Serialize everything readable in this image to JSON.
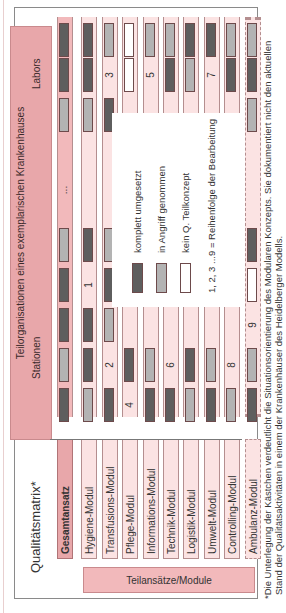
{
  "figure": {
    "title": "Qualitätsmatrix*",
    "header": {
      "title": "Teilorganisationen eines exemplarischen Krankenhauses",
      "group_left": "Stationen",
      "group_right": "Labors",
      "ellipsis": "..."
    },
    "side_label": "Teilansätze/Module",
    "columns": [
      "S1",
      "S2",
      "S3",
      "S4",
      "S5",
      "...",
      "L1",
      "L2",
      "L3"
    ],
    "rows": [
      {
        "label": "Gesamtansatz",
        "cells": [
          "dark",
          "light",
          "dark",
          "dark",
          "light",
          "...",
          "light",
          "dark",
          "dark"
        ]
      },
      {
        "label": "Hygiene-Modul",
        "cells": [
          "light",
          "dark",
          "dark",
          "1",
          "dark",
          "",
          "light",
          "dark",
          "dark"
        ]
      },
      {
        "label": "Transfusions-Modul",
        "cells": [
          "dark",
          "2",
          "light",
          "dark",
          "light",
          "",
          "dark",
          "3",
          "light"
        ]
      },
      {
        "label": "Pflege-Modul",
        "cells": [
          "4",
          "dark",
          "",
          "",
          "",
          "",
          "",
          "white",
          "white"
        ]
      },
      {
        "label": "Informations-Modul",
        "cells": [
          "dark",
          "light",
          "",
          "",
          "",
          "",
          "",
          "5",
          "light"
        ]
      },
      {
        "label": "Technik-Modul",
        "cells": [
          "dark",
          "6",
          "",
          "",
          "",
          "",
          "",
          "dark",
          "light"
        ]
      },
      {
        "label": "Logistik-Modul",
        "cells": [
          "light",
          "dark",
          "",
          "",
          "",
          "",
          "",
          "light",
          "dark"
        ]
      },
      {
        "label": "Umwelt-Modul",
        "cells": [
          "dark",
          "light",
          "",
          "",
          "",
          "",
          "",
          "7",
          "dark"
        ]
      },
      {
        "label": "Controlling-Modul",
        "cells": [
          "light",
          "8",
          "",
          "",
          "",
          "",
          "",
          "dark",
          "light"
        ]
      },
      {
        "label": "Ambulanz-Modul",
        "cells": [
          "dark",
          "light",
          "9",
          "white",
          "dark",
          "",
          "light",
          "dark",
          "light"
        ]
      }
    ],
    "legend": [
      {
        "swatch": "dark",
        "label": "komplett umgesetzt"
      },
      {
        "swatch": "light",
        "label": "in Angriff genommen"
      },
      {
        "swatch": "white",
        "label": "kein Q. Teilkonzept"
      },
      {
        "swatch": "",
        "label": "1, 2, 3 ...9 = Reihenfolge der Bearbeitung"
      }
    ],
    "footnote_line1": "*Die Unterlegung der Kästchen verdeutlicht die Situationsorientierung des Modularen Konzepts. Sie dokumentiert nicht den aktuellen",
    "footnote_line2": "Stand der Qualitätsaktivitäten in einem der Krankenhäuser des Heidelberger Modells.",
    "colors": {
      "pink_header": "#e8a7aa",
      "pink_light": "#fbe3e3",
      "dark_cell": "#5e5e5e",
      "light_cell": "#b3b3b3",
      "white_cell": "#ffffff"
    }
  }
}
